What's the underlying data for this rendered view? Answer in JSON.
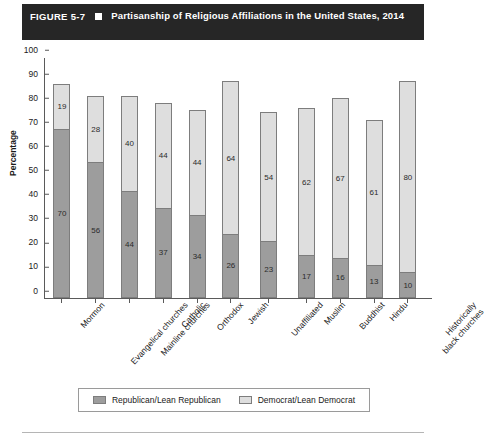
{
  "figure": {
    "number": "FIGURE 5-7",
    "bullet_icon": "filled-square-icon",
    "title": "Partisanship of Religious Affiliations in the United States, 2014"
  },
  "chart_data": {
    "type": "bar",
    "subtype": "stacked-vertical",
    "title": "Partisanship of Religious Affiliations in the United States, 2014",
    "xlabel": "",
    "ylabel": "Percentage",
    "ylim": [
      0,
      100
    ],
    "ytick_step": 10,
    "yticks": [
      "100",
      "90",
      "80",
      "70",
      "60",
      "50",
      "40",
      "30",
      "20",
      "10",
      "0"
    ],
    "grid": false,
    "legend_position": "bottom",
    "categories": [
      "Mormon",
      "Evangelical churches",
      "Mainline churches",
      "Catholic",
      "Orthodox",
      "Jewish",
      "Unaffiliated",
      "Muslim",
      "Buddhist",
      "Hindu",
      "Historically\nblack churches"
    ],
    "series": [
      {
        "name": "Republican/Lean Republican",
        "color": "#9d9d9d",
        "values": [
          70,
          56,
          44,
          37,
          34,
          26,
          23,
          17,
          16,
          13,
          10
        ]
      },
      {
        "name": "Democrat/Lean Democrat",
        "color": "#dedede",
        "values": [
          19,
          28,
          40,
          44,
          44,
          64,
          54,
          62,
          67,
          61,
          80
        ]
      }
    ]
  },
  "legend": {
    "items": [
      {
        "label": "Republican/Lean Republican",
        "swatch": "rep"
      },
      {
        "label": "Democrat/Lean Democrat",
        "swatch": "dem"
      }
    ]
  }
}
